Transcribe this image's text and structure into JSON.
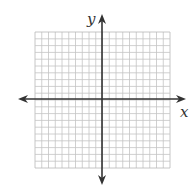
{
  "diagram": {
    "type": "coordinate-plane",
    "grid": {
      "columns": 20,
      "rows": 20,
      "left": 35,
      "top": 32,
      "right": 170,
      "bottom": 168,
      "line_color": "#c4c4c4",
      "border_color": "#b8b8b8"
    },
    "axes": {
      "origin_x": 102,
      "origin_y": 99,
      "color": "#333333",
      "x_axis": {
        "label": "x",
        "extends_left_to": 18,
        "extends_right_to": 186
      },
      "y_axis": {
        "label": "y",
        "extends_top_to": 14,
        "extends_bottom_to": 185
      }
    }
  }
}
